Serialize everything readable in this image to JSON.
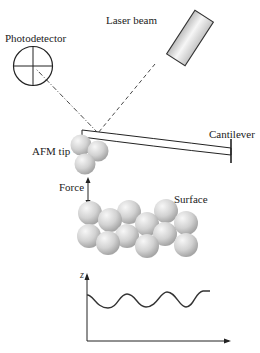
{
  "diagram": {
    "labels": {
      "photodetector": "Photodetector",
      "laser_beam": "Laser beam",
      "cantilever": "Cantilever",
      "afm_tip": "AFM tip",
      "force": "Force",
      "surface": "Surface",
      "z_axis": "z"
    },
    "colors": {
      "line": "#222222",
      "sphere_light": "#f2f2f2",
      "sphere_dark": "#a8a8a8",
      "laser_body_light": "#f4f4f4",
      "laser_body_dark": "#bdbdbd"
    }
  }
}
